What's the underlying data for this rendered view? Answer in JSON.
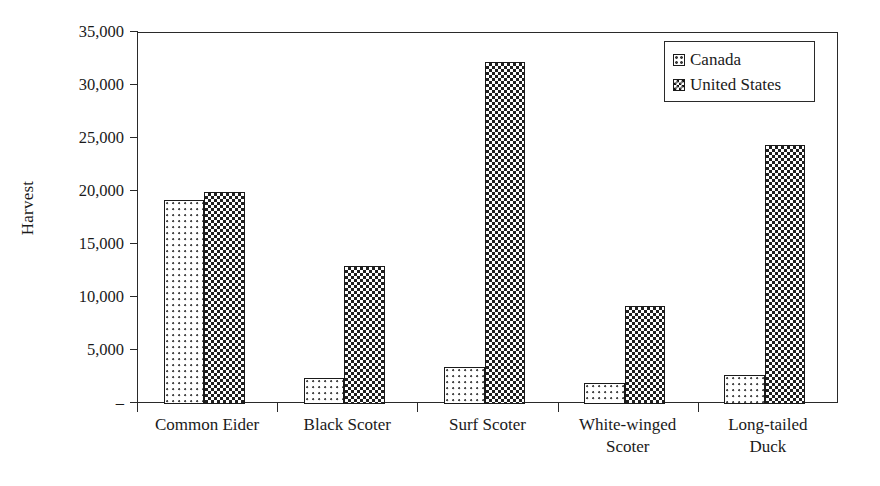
{
  "chart_data": {
    "type": "bar",
    "title": "",
    "xlabel": "",
    "ylabel": "Harvest",
    "ylim": [
      0,
      35000
    ],
    "ytick_values": [
      0,
      5000,
      10000,
      15000,
      20000,
      25000,
      30000,
      35000
    ],
    "ytick_labels": [
      "–",
      "5,000",
      "10,000",
      "15,000",
      "20,000",
      "25,000",
      "30,000",
      "35,000"
    ],
    "grid": false,
    "legend_position": "top-right",
    "categories": [
      "Common Eider",
      "Black Scoter",
      "Surf Scoter",
      "White-winged\nScoter",
      "Long-tailed\nDuck"
    ],
    "series": [
      {
        "name": "Canada",
        "pattern": "light-dotted",
        "color": "#ffffff",
        "values": [
          19200,
          2500,
          3450,
          1950,
          2700
        ]
      },
      {
        "name": "United States",
        "pattern": "dark-checkered",
        "color": "#1f1f1f",
        "values": [
          20000,
          13000,
          32300,
          9250,
          24450
        ]
      }
    ]
  },
  "legend": {
    "items": [
      {
        "label": "Canada",
        "swatch": "canada-swatch-icon"
      },
      {
        "label": "United States",
        "swatch": "united-states-swatch-icon"
      }
    ]
  },
  "axes": {
    "y_title": "Harvest"
  }
}
